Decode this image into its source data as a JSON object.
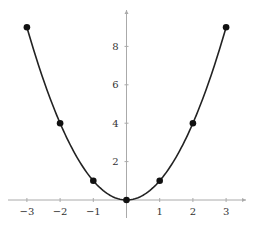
{
  "chart_data": {
    "type": "line",
    "title": "",
    "xlabel": "",
    "ylabel": "",
    "function": "y = x^2",
    "x": [
      -3,
      -2,
      -1,
      0,
      1,
      2,
      3
    ],
    "series": [
      {
        "name": "y = x^2",
        "values": [
          9,
          4,
          1,
          0,
          1,
          4,
          9
        ],
        "markers": true,
        "curve": "smooth"
      }
    ],
    "x_ticks": [
      -3,
      -2,
      -1,
      1,
      2,
      3
    ],
    "y_ticks": [
      2,
      4,
      6,
      8
    ],
    "xlim": [
      -3.1,
      3.6
    ],
    "ylim": [
      0,
      10
    ],
    "grid": false,
    "legend": null
  },
  "style": {
    "curve_color": "#222222",
    "marker_color": "#111111",
    "axis_color": "#aaaaaa",
    "label_color": "#333333"
  }
}
